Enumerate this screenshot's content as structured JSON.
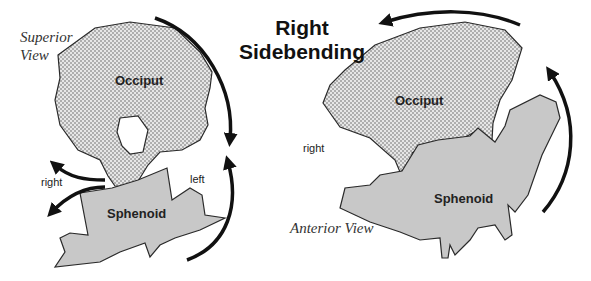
{
  "title": {
    "line1": "Right",
    "line2": "Sidebending"
  },
  "left_panel": {
    "view_label_line1": "Superior",
    "view_label_line2": "View",
    "occiput_label": "Occiput",
    "sphenoid_label": "Sphenoid",
    "right_label": "right",
    "left_label": "left"
  },
  "right_panel": {
    "view_label": "Anterior View",
    "occiput_label": "Occiput",
    "sphenoid_label": "Sphenoid",
    "right_label": "right"
  },
  "colors": {
    "occiput_fill": "#d4d4d4",
    "sphenoid_fill": "#c8c8c8",
    "outline": "#2a2a2a",
    "arrow": "#111111"
  }
}
